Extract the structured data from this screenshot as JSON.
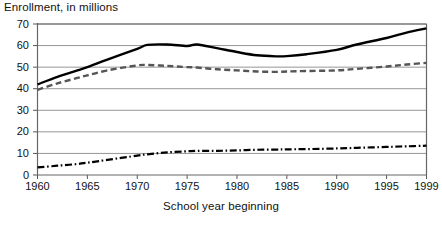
{
  "chart_data": {
    "type": "line",
    "title": "Enrollment, in millions",
    "xlabel": "School year beginning",
    "ylabel": "",
    "xlim": [
      1960,
      1999
    ],
    "ylim": [
      0,
      70
    ],
    "grid": true,
    "legend": "none",
    "yticks": [
      0,
      10,
      20,
      30,
      40,
      50,
      60,
      70
    ],
    "xticks": [
      1960,
      1965,
      1970,
      1975,
      1980,
      1985,
      1990,
      1995,
      1999
    ],
    "x": [
      1960,
      1962,
      1964,
      1965,
      1967,
      1970,
      1971,
      1973,
      1975,
      1976,
      1978,
      1980,
      1982,
      1984,
      1985,
      1987,
      1990,
      1992,
      1995,
      1997,
      1999
    ],
    "series": [
      {
        "name": "Total enrollment",
        "style": "solid",
        "color": "#000000",
        "values": [
          42.0,
          45.5,
          48.5,
          50.0,
          53.5,
          58.5,
          60.3,
          60.5,
          59.8,
          60.5,
          58.8,
          57.0,
          55.5,
          55.0,
          55.1,
          56.0,
          58.0,
          60.5,
          63.5,
          66.0,
          68.0
        ]
      },
      {
        "name": "Public elementary and secondary",
        "style": "dashed",
        "color": "#555555",
        "values": [
          39.5,
          42.5,
          45.0,
          46.2,
          48.5,
          50.8,
          51.0,
          50.6,
          50.0,
          49.8,
          49.0,
          48.5,
          48.0,
          47.8,
          48.0,
          48.2,
          48.5,
          49.2,
          50.3,
          51.2,
          52.0
        ]
      },
      {
        "name": "Private and higher education",
        "style": "dash-dot",
        "color": "#000000",
        "values": [
          3.5,
          4.3,
          5.1,
          5.7,
          7.0,
          9.0,
          9.6,
          10.5,
          11.0,
          11.2,
          11.2,
          11.4,
          11.7,
          11.8,
          11.9,
          12.0,
          12.3,
          12.6,
          13.0,
          13.3,
          13.6
        ]
      }
    ]
  }
}
